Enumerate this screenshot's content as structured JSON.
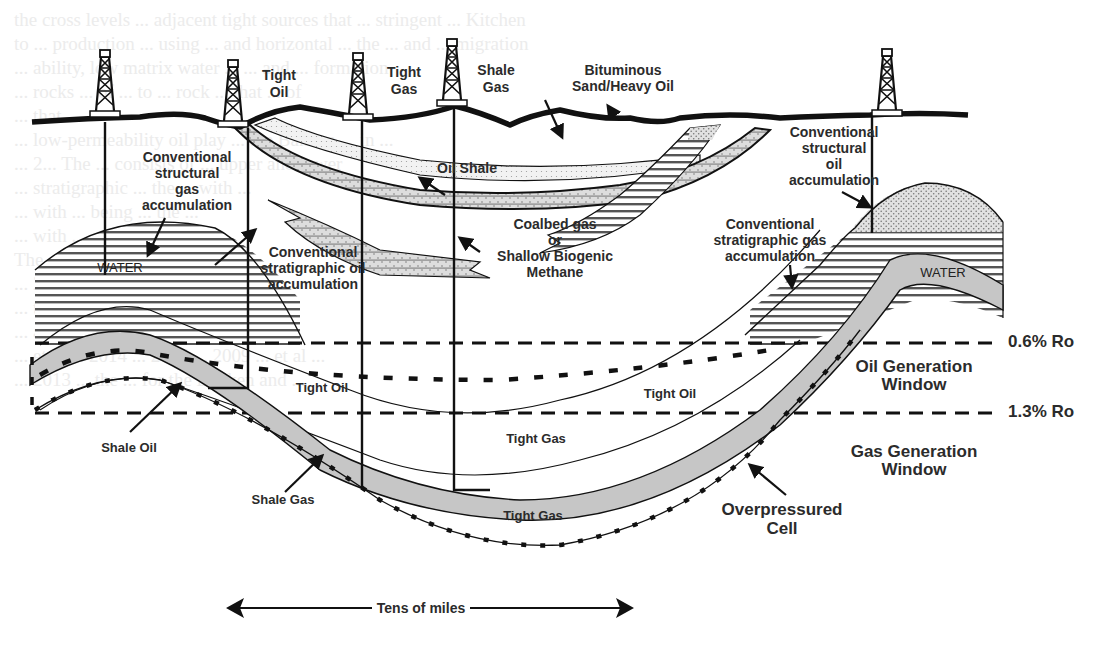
{
  "figure": {
    "type": "geologic-cross-section"
  },
  "wells": [
    {
      "id": "well-1",
      "label": ""
    },
    {
      "id": "well-tight-oil",
      "label_line1": "Tight",
      "label_line2": "Oil"
    },
    {
      "id": "well-tight-gas",
      "label_line1": "Tight",
      "label_line2": "Gas"
    },
    {
      "id": "well-shale-gas",
      "label_line1": "Shale",
      "label_line2": "Gas"
    },
    {
      "id": "well-5",
      "label": ""
    }
  ],
  "labels": {
    "bituminous": {
      "line1": "Bituminous",
      "line2": "Sand/Heavy Oil"
    },
    "oil_shale": "Oil Shale",
    "conv_struct_gas": {
      "line1": "Conventional",
      "line2": "structural",
      "line3": "gas",
      "line4": "accumulation"
    },
    "conv_strat_oil": {
      "line1": "Conventional",
      "line2": "stratigraphic oil",
      "line3": "accumulation"
    },
    "coalbed": {
      "line1": "Coalbed gas",
      "line2": "or",
      "line3": "Shallow Biogenic",
      "line4": "Methane"
    },
    "conv_struct_oil": {
      "line1": "Conventional",
      "line2": "structural",
      "line3": "oil",
      "line4": "accumulation"
    },
    "conv_strat_gas": {
      "line1": "Conventional",
      "line2": "stratigraphic gas",
      "line3": "accumulation"
    },
    "water_left": "WATER",
    "water_right": "WATER",
    "ro_06": "0.6% Ro",
    "ro_13": "1.3% Ro",
    "oil_window": {
      "line1": "Oil Generation",
      "line2": "Window"
    },
    "gas_window": {
      "line1": "Gas Generation",
      "line2": "Window"
    },
    "tight_oil_1": "Tight Oil",
    "tight_oil_2": "Tight Oil",
    "tight_gas_1": "Tight Gas",
    "tight_gas_2": "Tight Gas",
    "shale_oil": "Shale Oil",
    "shale_gas": "Shale Gas",
    "overpressured": {
      "line1": "Overpressured",
      "line2": "Cell"
    },
    "scale": "Tens of miles"
  },
  "colors": {
    "ink": "#1a1a1a",
    "shale_band": "#c4c4c4",
    "stipple": "#bdbdbd",
    "ghost_text": "#ececec"
  },
  "ghost_text": [
    "the cross levels ... adjacent tight sources that ... stringent ... Kitchen",
    "to ... production ... using ... and horizontal ... the ... and ... migration",
    "... ability, low matrix water ... ... and ... formation",
    "... rocks ... of ... to ... rock ... that ... of",
    "... that ...",
    "... low-permeability oil play ... the Bakken ... in ...",
    "... 2... The ... consists of ... upper and lower",
    "... stratigraphic ... the ... with ...",
    "... with ... being ... the ...",
    "... with ... ... optimal ...",
    "The ... Petroleum ... the ...",
    "... 2... Tight ... ...",
    "... the ... of ... the ...",
    "... and ... the ... Bakken ... et al. ...",
    "... et al ... 2014 ... 2015 ... 2009 ... et al ...",
    "... 2013 ... the ... for the Bakken and ..."
  ]
}
